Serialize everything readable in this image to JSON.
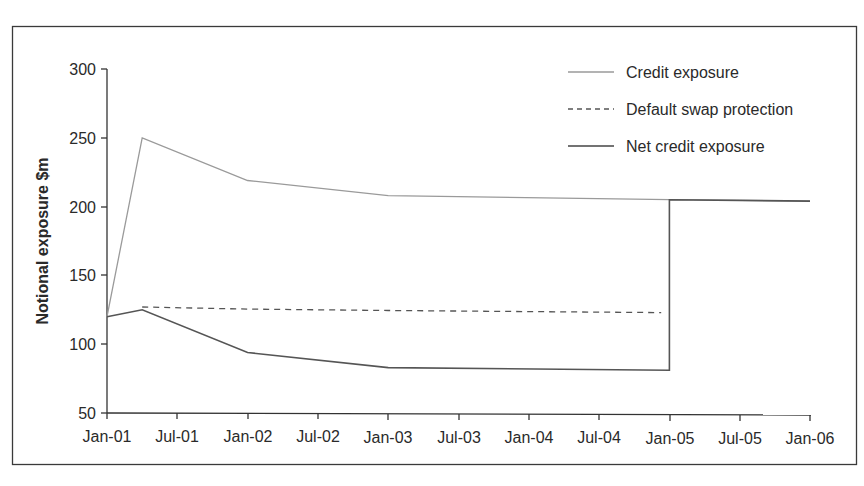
{
  "chart_data": {
    "type": "line",
    "title": "",
    "xlabel": "",
    "ylabel": "Notional exposure $m",
    "ylim": [
      50,
      300
    ],
    "yticks": [
      50,
      100,
      150,
      200,
      250,
      300
    ],
    "xticks": [
      "Jan-01",
      "Jul-01",
      "Jan-02",
      "Jul-02",
      "Jan-03",
      "Jul-03",
      "Jan-04",
      "Jul-04",
      "Jan-05",
      "Jul-05",
      "Jan-06"
    ],
    "x_unit": "months since Jan-01",
    "grid": false,
    "legend_position": "top-right",
    "series": [
      {
        "name": "Credit exposure",
        "style": "solid-light",
        "color": "#9a9a9a",
        "points": [
          [
            0,
            120
          ],
          [
            3,
            250
          ],
          [
            12,
            219
          ],
          [
            24,
            208
          ],
          [
            48,
            205
          ],
          [
            60,
            204
          ]
        ]
      },
      {
        "name": "Default swap protection",
        "style": "dashed",
        "color": "#555555",
        "points": [
          [
            3,
            127
          ],
          [
            12,
            125.5
          ],
          [
            24,
            124.5
          ],
          [
            47.3,
            123
          ]
        ]
      },
      {
        "name": "Net credit exposure",
        "style": "solid-dark",
        "color": "#555555",
        "points": [
          [
            0,
            120
          ],
          [
            3,
            125
          ],
          [
            12,
            94
          ],
          [
            24,
            83
          ],
          [
            48,
            81
          ],
          [
            48,
            205
          ],
          [
            60,
            204
          ]
        ]
      }
    ]
  },
  "legend": {
    "items": [
      {
        "label": "Credit exposure"
      },
      {
        "label": "Default swap protection"
      },
      {
        "label": "Net credit exposure"
      }
    ]
  },
  "axes": {
    "y_title": "Notional exposure $m",
    "y_labels": [
      "300",
      "250",
      "200",
      "150",
      "100",
      "50"
    ],
    "x_labels": [
      "Jan-01",
      "Jul-01",
      "Jan-02",
      "Jul-02",
      "Jan-03",
      "Jul-03",
      "Jan-04",
      "Jul-04",
      "Jan-05",
      "Jul-05",
      "Jan-06"
    ]
  }
}
